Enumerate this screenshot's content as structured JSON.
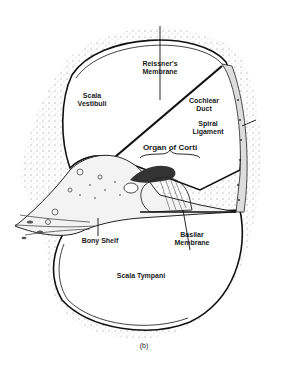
{
  "diagram": {
    "labels": {
      "reissners_membrane": "Reissner's\nMembrane",
      "scala_vestibuli": "Scala\nVestibuli",
      "cochlear_duct": "Cochlear\nDuct",
      "spiral_ligament": "Spiral\nLigament",
      "organ_of_corti": "Organ of Corti",
      "basilar_membrane": "Basilar\nMembrane",
      "bony_shelf": "Bony Shelf",
      "scala_tympani": "Scala Tympani"
    },
    "caption": "(b)"
  }
}
